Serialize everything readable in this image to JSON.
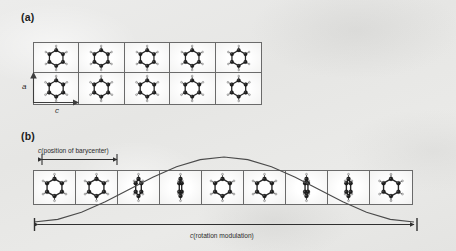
{
  "figure": {
    "background_color": "#e9e9e7",
    "line_color": "#4a4a4a"
  },
  "panels": [
    {
      "id": "a",
      "label": "(a)",
      "description": "undistorted structure: 5 by 2 array of upright benzene molecules",
      "grid": {
        "columns": 5,
        "rows": 2
      },
      "axes": [
        {
          "name": "a-axis",
          "label": "a",
          "direction": "up"
        },
        {
          "name": "c-axis",
          "label": "c",
          "direction": "right"
        }
      ],
      "molecule_orientations_deg": [
        [
          0,
          0,
          0,
          0,
          0
        ],
        [
          0,
          0,
          0,
          0,
          0
        ]
      ]
    },
    {
      "id": "b",
      "label": "(b)",
      "description": "rotation-modulated structure: row of 9 benzene molecules with progressively varying rotation, overlaid by a modulation wave",
      "grid": {
        "columns": 9,
        "rows": 1
      },
      "molecule_orientations_deg": [
        0,
        0,
        72,
        86,
        0,
        0,
        84,
        78,
        0
      ],
      "labels": {
        "barycenter": {
          "prefix": "c",
          "text": "(position of barycenter)",
          "full": "c(position of barycenter)"
        },
        "modulation": {
          "prefix": "c",
          "text": "(rotation modulation)",
          "full": "c(rotation modulation)"
        }
      },
      "wave": {
        "type": "modulation-curve",
        "shape": "single cosine period",
        "description": "rises from lower-left, crests near centre, falls to lower-right"
      }
    }
  ],
  "chart_data": {
    "type": "line",
    "title": "",
    "xlabel": "c(rotation modulation)",
    "ylabel": "",
    "x": [
      0,
      0.0625,
      0.125,
      0.1875,
      0.25,
      0.3125,
      0.375,
      0.4375,
      0.5,
      0.5625,
      0.625,
      0.6875,
      0.75,
      0.8125,
      0.875,
      0.9375,
      1.0
    ],
    "series": [
      {
        "name": "rotation modulation",
        "values": [
          0.0,
          0.04,
          0.15,
          0.31,
          0.5,
          0.69,
          0.85,
          0.96,
          1.0,
          0.96,
          0.85,
          0.69,
          0.5,
          0.31,
          0.15,
          0.04,
          0.0
        ]
      }
    ],
    "xlim": [
      0,
      1
    ],
    "ylim": [
      0,
      1
    ],
    "grid": false,
    "legend": "none"
  }
}
